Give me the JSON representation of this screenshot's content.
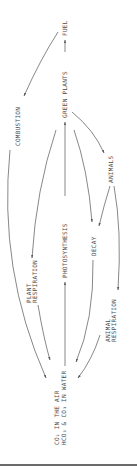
{
  "diagram": {
    "title": "",
    "orientation": "rotated-90-ccw",
    "nodes": {
      "fuel": "FUEL",
      "green_plants": "GREEN PLANTS",
      "animals": "ANIMALS",
      "decay": "DECAY",
      "co2_air_line1": "CO₂ IN THE AIR",
      "co2_air_line2": "HCO₃ & CO₃ IN WATER"
    },
    "processes": {
      "combustion": "COMBUSTION",
      "photosynthesis": "PHOTOSYNTHESIS",
      "plant_respiration_line1": "PLANT",
      "plant_respiration_line2": "RESPIRATION",
      "animal_respiration_line1": "ANIMAL",
      "animal_respiration_line2": "RESPIRATION"
    },
    "edges": [
      {
        "from": "GREEN PLANTS",
        "to": "FUEL"
      },
      {
        "from": "FUEL",
        "to": "CO₂ IN THE AIR",
        "label": "COMBUSTION"
      },
      {
        "from": "CO₂ IN THE AIR",
        "to": "GREEN PLANTS",
        "label": "PHOTOSYNTHESIS"
      },
      {
        "from": "GREEN PLANTS",
        "to": "CO₂ IN THE AIR",
        "label": "PLANT RESPIRATION"
      },
      {
        "from": "GREEN PLANTS",
        "to": "ANIMALS"
      },
      {
        "from": "GREEN PLANTS",
        "to": "DECAY"
      },
      {
        "from": "ANIMALS",
        "to": "DECAY"
      },
      {
        "from": "DECAY",
        "to": "CO₂ IN THE AIR"
      },
      {
        "from": "ANIMALS",
        "to": "CO₂ IN THE AIR",
        "label": "ANIMAL RESPIRATION"
      }
    ],
    "colors": {
      "line": "#555555",
      "text": "#4a4a4a",
      "background": "#ffffff",
      "bottom_rule": "#6a6a6a"
    }
  }
}
